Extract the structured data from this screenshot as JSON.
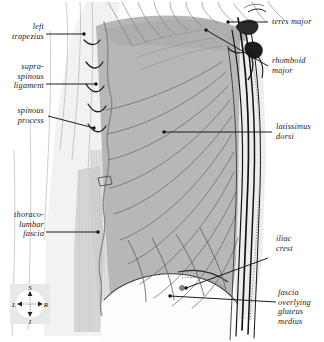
{
  "figure": {
    "background_color": "#ffffff",
    "muscle_fill": "#b7b7b7",
    "fascia_fill": "#c9c9c9",
    "pale_fill": "#e4e4e4",
    "line_color": "#1a1a1a",
    "fiber_color": "#5d5d5d"
  },
  "labels": {
    "left_trapezius": "left\ntrapezius",
    "supraspinous_ligament": "supra-\nspinous\nligament",
    "spinous_process": "spinous\nprocess",
    "thoracolumbar_fascia": "thoraco-\nlumbar\nfascia",
    "teres_major": "teres major",
    "rhomboid_major": "rhomboid\nmajor",
    "latissimus_dorsi": "latissimus\ndorsi",
    "iliac_crest": "iliac\ncrest",
    "gluteus_medius_fascia": "fascia\noverlying\ngluteus\nmedius"
  },
  "compass": {
    "superior": "S",
    "inferior": "I",
    "left": "L",
    "right": "R",
    "box_color": "#e8e8e8",
    "disc_color": "#ffffff"
  }
}
